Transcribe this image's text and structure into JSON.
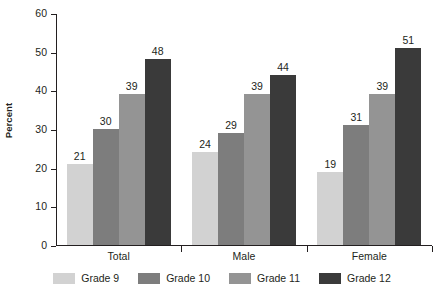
{
  "chart_data": {
    "type": "bar",
    "title": "",
    "subtitle": "",
    "xlabel": "",
    "ylabel": "Percent",
    "ylim": [
      0,
      60
    ],
    "yticks": [
      0,
      10,
      20,
      30,
      40,
      50,
      60
    ],
    "ytick_labels": [
      "0",
      "10",
      "20",
      "30",
      "40",
      "50",
      "60"
    ],
    "grid": false,
    "legend_position": "bottom",
    "categories": [
      "Total",
      "Male",
      "Female"
    ],
    "series": [
      {
        "name": "Grade 9",
        "color": "#d2d2d2",
        "values": [
          21,
          30,
          19
        ]
      },
      {
        "name": "Grade 10",
        "color": "#7d7d7d",
        "values": [
          30,
          29,
          31
        ]
      },
      {
        "name": "Grade 11",
        "color": "#949494",
        "values": [
          39,
          39,
          39
        ]
      },
      {
        "name": "Grade 12",
        "color": "#3a3a3a",
        "values": [
          48,
          44,
          51
        ]
      }
    ],
    "groups": [
      {
        "label": "Total",
        "bars": [
          {
            "series": "Grade 9",
            "value": 21,
            "label": "21",
            "color": "#d2d2d2"
          },
          {
            "series": "Grade 10",
            "value": 30,
            "label": "30",
            "color": "#7d7d7d"
          },
          {
            "series": "Grade 11",
            "value": 39,
            "label": "39",
            "color": "#949494"
          },
          {
            "series": "Grade 12",
            "value": 48,
            "label": "48",
            "color": "#3a3a3a"
          }
        ]
      },
      {
        "label": "Male",
        "bars": [
          {
            "series": "Grade 9",
            "value": 24,
            "label": "24",
            "color": "#d2d2d2"
          },
          {
            "series": "Grade 10",
            "value": 29,
            "label": "29",
            "color": "#7d7d7d"
          },
          {
            "series": "Grade 11",
            "value": 39,
            "label": "39",
            "color": "#949494"
          },
          {
            "series": "Grade 12",
            "value": 44,
            "label": "44",
            "color": "#3a3a3a"
          }
        ]
      },
      {
        "label": "Female",
        "bars": [
          {
            "series": "Grade 9",
            "value": 19,
            "label": "19",
            "color": "#d2d2d2"
          },
          {
            "series": "Grade 10",
            "value": 31,
            "label": "31",
            "color": "#7d7d7d"
          },
          {
            "series": "Grade 11",
            "value": 39,
            "label": "39",
            "color": "#949494"
          },
          {
            "series": "Grade 12",
            "value": 51,
            "label": "51",
            "color": "#3a3a3a"
          }
        ]
      }
    ]
  },
  "legend": {
    "items": [
      {
        "label": "Grade 9",
        "color": "#d2d2d2"
      },
      {
        "label": "Grade 10",
        "color": "#7d7d7d"
      },
      {
        "label": "Grade 11",
        "color": "#949494"
      },
      {
        "label": "Grade 12",
        "color": "#3a3a3a"
      }
    ]
  },
  "colors": {
    "background": "#ffffff",
    "axis": "#231f20",
    "text": "#231f20",
    "grade9": "#d2d2d2",
    "grade10": "#7d7d7d",
    "grade11": "#949494",
    "grade12": "#3a3a3a"
  }
}
